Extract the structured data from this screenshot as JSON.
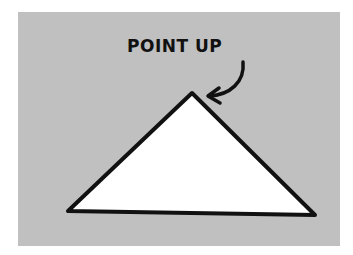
{
  "illustration": {
    "annotation_text": "POINT UP",
    "background_color": "#c0c0c0",
    "shape_fill": "#ffffff",
    "stroke_color": "#111111",
    "shape": "triangle",
    "arrow": "curved-arrow-pointing-at-apex"
  }
}
